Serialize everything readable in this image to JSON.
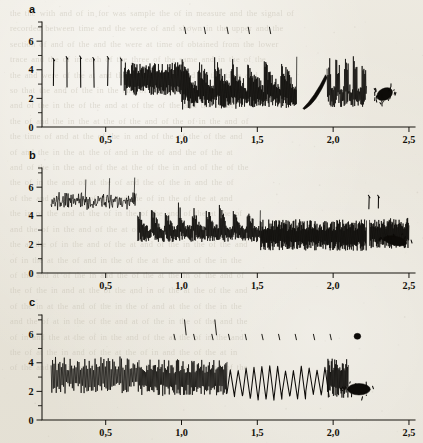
{
  "figure": {
    "title": "",
    "background_color": "#e9e6dd",
    "ink_color": "#0d0b08",
    "width": 423,
    "height": 443,
    "panel_count": 3
  },
  "bleed_through_text": "the the with and of in for was sample the of in measure and the signal of\nrecorded between time and the were of and shown in the upper and the\nsection of and of the and the were at time of obtained from the lower\ntrace and the of in each of the three of the same and in the of the\nthe and were of the at and the of the in the and of the time and\nso that the and of the in the and of and the of at the of the\nand of the in the of the and at of the of the and the in of\nthe of and the in the at the of the and of the of in the and of\nthe time of and at the of the in and of the of the of the and\nof and the in the at the of and in the of and the of the at\nand of the in the and of the at the of the in and of the of the\nthe of in the and of at the of and the of the in and the of\nof the and in the at of the and the of in the of the at and\nthe in of the and at the of in the of the and of the at the of\nand the of in the and of the at of the in the and of the of\nthe at the of in the and of the at and of the in the of the and\nof in the at the of and in the of the at the and of the in the\nof the and at of the in and the of the at the in of the and of\nthe of the in and at the of the and in of the at the of the and\nof the in at the and of the in the of and at the of the in the\nand the of at in the of the and at of the in the of the and the\nof in and the at the of in the and of the at the of in the and\nthe of at the in and of the at the of in and the of the at in\nof the and the in at the of and the in of the at the and of the",
  "chart_data": [
    {
      "type": "line",
      "panel_label": "a",
      "title": "",
      "xlabel": "",
      "ylabel": "",
      "xlim": [
        0.08,
        2.52
      ],
      "ylim": [
        0,
        7.2
      ],
      "xticks": [
        0.5,
        1.0,
        1.5,
        2.0,
        2.5
      ],
      "xticklabels": [
        "0,5",
        "1,0",
        "1,5",
        "2,0",
        "2,5"
      ],
      "yticks": [
        0,
        1,
        2,
        3,
        4,
        5,
        6,
        7
      ],
      "yticklabels_shown": {
        "0": "0",
        "2": "2",
        "4": "4",
        "6": "6"
      },
      "grid": false,
      "legend": null,
      "description": "sparse isolated vertical spikes on the left becoming a dense high-frequency oscillating trace that drifts downward, ending in a solid dark blob",
      "segments": [
        {
          "kind": "isolated-spikes",
          "x_start": 0.16,
          "x_end": 0.6,
          "count": 6,
          "y_top": 4.85,
          "y_bottom": 2.75,
          "jitter": 0.18
        },
        {
          "kind": "dense-oscillation",
          "x_start": 0.62,
          "x_end": 1.0,
          "y_high": 4.55,
          "y_low": 2.2,
          "density": 150,
          "envelope": "flat"
        },
        {
          "kind": "dense-oscillation",
          "x_start": 1.0,
          "x_end": 1.76,
          "y_high": 5.05,
          "y_low": 1.15,
          "density": 320,
          "envelope": "sawtooth-bursts"
        },
        {
          "kind": "ramp",
          "x_start": 1.8,
          "x_end": 1.95,
          "y_start": 1.3,
          "y_end": 3.65,
          "thickness": 0.55
        },
        {
          "kind": "dense-oscillation",
          "x_start": 1.96,
          "x_end": 2.22,
          "y_high": 5.15,
          "y_low": 1.2,
          "density": 90,
          "envelope": "tall-columns"
        },
        {
          "kind": "blob",
          "x_center": 2.34,
          "y_center": 2.3,
          "rx": 0.055,
          "ry": 0.8,
          "angle": -28
        }
      ],
      "upper_marks": {
        "y": 6.75,
        "x_values": [
          1.02,
          1.15,
          1.3,
          1.44,
          1.58
        ],
        "length": 0.45
      }
    },
    {
      "type": "line",
      "panel_label": "b",
      "title": "",
      "xlabel": "",
      "ylabel": "",
      "xlim": [
        0.08,
        2.52
      ],
      "ylim": [
        0,
        7.2
      ],
      "xticks": [
        0.5,
        1.0,
        1.5,
        2.0,
        2.5
      ],
      "xticklabels": [
        "0,5",
        "1,0",
        "1,5",
        "2,0",
        "2,5"
      ],
      "yticks": [
        0,
        1,
        2,
        3,
        4,
        5,
        6,
        7
      ],
      "yticklabels_shown": {
        "0": "0",
        "2": "2",
        "4": "4",
        "6": "6"
      },
      "grid": false,
      "legend": null,
      "description": "low-amplitude noise band near y=5 on the left, abrupt transition near x=0.70 to a dense heavy oscillation centred near y=3 that settles toward y=2.4 with a dark blob at the right end",
      "segments": [
        {
          "kind": "noise-band",
          "x_start": 0.14,
          "x_end": 0.7,
          "y_center": 5.0,
          "amplitude": 0.55,
          "density": 170,
          "spike_count": 3,
          "spike_top": 6.8
        },
        {
          "kind": "dense-oscillation",
          "x_start": 0.71,
          "x_end": 1.52,
          "y_high": 4.95,
          "y_low": 1.85,
          "density": 300,
          "envelope": "burst-peaks"
        },
        {
          "kind": "dense-oscillation",
          "x_start": 1.52,
          "x_end": 2.22,
          "y_high": 3.75,
          "y_low": 1.55,
          "density": 330,
          "envelope": "flat"
        },
        {
          "kind": "isolated-spikes",
          "x_start": 2.24,
          "x_end": 2.3,
          "count": 2,
          "y_top": 5.35,
          "y_bottom": 4.45,
          "jitter": 0.1
        },
        {
          "kind": "dense-oscillation",
          "x_start": 2.24,
          "x_end": 2.5,
          "y_high": 3.85,
          "y_low": 1.7,
          "density": 120,
          "envelope": "flat"
        },
        {
          "kind": "blob",
          "x_center": 2.41,
          "y_center": 2.25,
          "rx": 0.075,
          "ry": 0.62,
          "angle": 12
        }
      ],
      "upper_marks": {
        "y": null,
        "x_values": [],
        "length": 0
      }
    },
    {
      "type": "line",
      "panel_label": "c",
      "title": "",
      "xlabel": "",
      "ylabel": "",
      "xlim": [
        0.08,
        2.52
      ],
      "ylim": [
        0,
        7.2
      ],
      "xticks": [
        0.5,
        1.0,
        1.5,
        2.0,
        2.5
      ],
      "xticklabels": [
        "0,5",
        "1,0",
        "1,5",
        "2,0",
        "2,5"
      ],
      "yticks": [
        0,
        1,
        2,
        3,
        4,
        5,
        6,
        7
      ],
      "yticklabels_shown": {
        "0": "0",
        "2": "2",
        "4": "4",
        "6": "6"
      },
      "grid": false,
      "legend": null,
      "description": "regular saw-tooth oscillation between about y=1.5 and y=4.3 across the whole range, slowly decaying in amplitude, terminating near x=2.2 with a dark blob; a row of short evenly spaced tick marks sits near y=5.8 above the trace",
      "segments": [
        {
          "kind": "dense-oscillation",
          "x_start": 0.14,
          "x_end": 0.72,
          "y_high": 4.45,
          "y_low": 1.85,
          "density": 120,
          "envelope": "flat"
        },
        {
          "kind": "dense-oscillation",
          "x_start": 0.72,
          "x_end": 1.3,
          "y_high": 4.25,
          "y_low": 1.65,
          "density": 160,
          "envelope": "flat"
        },
        {
          "kind": "sawtooth",
          "x_start": 1.3,
          "x_end": 1.95,
          "y_high": 3.85,
          "y_low": 1.35,
          "period": 0.052
        },
        {
          "kind": "dense-oscillation",
          "x_start": 1.96,
          "x_end": 2.1,
          "y_high": 4.35,
          "y_low": 1.55,
          "density": 50,
          "envelope": "flat"
        },
        {
          "kind": "blob",
          "x_center": 2.17,
          "y_center": 2.15,
          "rx": 0.075,
          "ry": 0.8,
          "angle": 0
        }
      ],
      "upper_marks": {
        "y": 5.8,
        "x_values": [
          0.95,
          1.08,
          1.2,
          1.31,
          1.42,
          1.53,
          1.64,
          1.75,
          1.87,
          1.98
        ],
        "length": 0.38
      },
      "tall_marks": {
        "y_top": 7.0,
        "y_bottom": 5.95,
        "x_values": [
          1.02,
          1.22
        ]
      },
      "upper_blob": {
        "x_center": 2.16,
        "y_center": 5.85,
        "rx": 0.022,
        "ry": 0.38
      }
    }
  ]
}
